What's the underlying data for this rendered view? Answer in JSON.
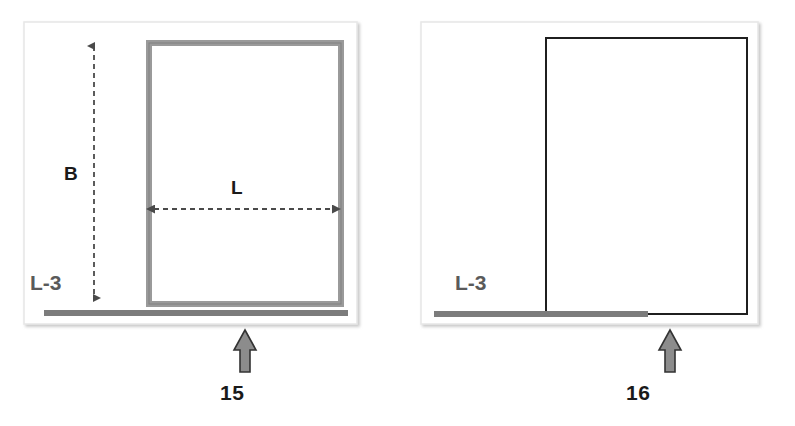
{
  "figure": {
    "title": "",
    "background_color": "#ffffff",
    "panels": [
      {
        "id": "panel-left",
        "number": "15",
        "frame": {
          "x": 24,
          "y": 22,
          "width": 333,
          "height": 302,
          "border_color": "#e8e8e8",
          "fill": "#ffffff"
        },
        "rectangle": {
          "x": 146,
          "y": 40,
          "width": 198,
          "height": 264,
          "stroke": "#9a9a9a",
          "stroke_width": 6,
          "fill": "#ffffff",
          "style": "thick-gray-outline"
        },
        "baseline": {
          "x1": 44,
          "x2": 348,
          "y": 313,
          "color": "#7c7c7c",
          "thickness": 6
        },
        "dimensions": [
          {
            "name": "B",
            "label": "B",
            "orientation": "vertical",
            "style": "dashed-double-arrow",
            "x": 94,
            "y1": 38,
            "y2": 306,
            "color": "#4a4a4a"
          },
          {
            "name": "L",
            "label": "L",
            "orientation": "horizontal",
            "style": "dashed-double-arrow",
            "y": 209,
            "x1": 146,
            "x2": 340,
            "color": "#4a4a4a"
          }
        ],
        "base_label": "L-3",
        "base_label_color": "#5a5a5a",
        "callout_arrow": {
          "x": 245,
          "y_tip": 330,
          "y_tail": 372,
          "fill": "#8c8c8c",
          "stroke": "#333333"
        }
      },
      {
        "id": "panel-right",
        "number": "16",
        "frame": {
          "x": 421,
          "y": 22,
          "width": 337,
          "height": 302,
          "border_color": "#e8e8e8",
          "fill": "#ffffff"
        },
        "rectangle": {
          "x": 546,
          "y": 38,
          "width": 201,
          "height": 275,
          "stroke": "#1f1f1f",
          "stroke_width": 2,
          "fill": "#ffffff",
          "style": "thin-black-outline"
        },
        "baseline": {
          "x1": 434,
          "x2": 648,
          "y": 314,
          "color": "#7c7c7c",
          "thickness": 6
        },
        "dimensions": [],
        "base_label": "L-3",
        "base_label_color": "#5a5a5a",
        "callout_arrow": {
          "x": 670,
          "y_tip": 330,
          "y_tail": 372,
          "fill": "#8c8c8c",
          "stroke": "#333333"
        }
      }
    ],
    "colors": {
      "panel_border": "#e8e8e8",
      "gray_member": "#9a9a9a",
      "dark_member": "#1f1f1f",
      "baseline_gray": "#7c7c7c",
      "dimension_line": "#4a4a4a",
      "callout_fill": "#8c8c8c",
      "callout_stroke": "#333333",
      "text_dark": "#1a1a1a",
      "text_gray": "#5a5a5a"
    }
  }
}
